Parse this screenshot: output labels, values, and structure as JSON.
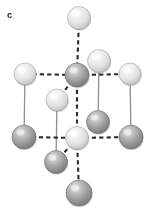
{
  "figure": {
    "panel_label": "c",
    "caption": "",
    "width": 153,
    "height": 211,
    "background": "#ffffff",
    "type": "crystal-structure-unit-cell"
  },
  "colors": {
    "light_atom_fill": "#e2e2e2",
    "light_atom_highlight": "#fbfbfb",
    "light_atom_edge": "#9a9a9a",
    "dark_atom_fill": "#9b9b9b",
    "dark_atom_highlight": "#d6d6d6",
    "dark_atom_edge": "#6a6a6a",
    "solid_bond": "#8f8f8f",
    "dashed_bond": "#2b2b2b",
    "label_color": "#1a1a1a"
  },
  "atoms": [
    {
      "id": "atom-top-apex",
      "cx": 79,
      "cy": 18,
      "r": 11.5,
      "shade": "light",
      "label": ""
    },
    {
      "id": "atom-upper-right",
      "cx": 99,
      "cy": 61,
      "r": 11.5,
      "shade": "light",
      "label": ""
    },
    {
      "id": "atom-center-upper",
      "cx": 77,
      "cy": 75,
      "r": 12.0,
      "shade": "dark",
      "label": ""
    },
    {
      "id": "atom-left-upper",
      "cx": 25,
      "cy": 74,
      "r": 11.0,
      "shade": "light",
      "label": ""
    },
    {
      "id": "atom-right-upper",
      "cx": 130,
      "cy": 74,
      "r": 11.0,
      "shade": "light",
      "label": ""
    },
    {
      "id": "atom-mid-left",
      "cx": 57,
      "cy": 100,
      "r": 11.0,
      "shade": "light",
      "label": ""
    },
    {
      "id": "atom-mid-right",
      "cx": 98,
      "cy": 122,
      "r": 11.5,
      "shade": "dark",
      "label": ""
    },
    {
      "id": "atom-left-lower",
      "cx": 24,
      "cy": 137,
      "r": 12.0,
      "shade": "dark",
      "label": ""
    },
    {
      "id": "atom-center-lower",
      "cx": 77,
      "cy": 138,
      "r": 11.5,
      "shade": "light",
      "label": ""
    },
    {
      "id": "atom-right-lower",
      "cx": 131,
      "cy": 137,
      "r": 12.0,
      "shade": "dark",
      "label": ""
    },
    {
      "id": "atom-lower-left-sub",
      "cx": 56,
      "cy": 162,
      "r": 11.5,
      "shade": "dark",
      "label": ""
    },
    {
      "id": "atom-bottom-apex",
      "cx": 79,
      "cy": 193,
      "r": 13.0,
      "shade": "dark",
      "label": ""
    }
  ],
  "bonds_dashed": [
    {
      "id": "bond-vertical-axis-top",
      "x1": 79,
      "y1": 18,
      "x2": 77,
      "y2": 75
    },
    {
      "id": "bond-vertical-axis-mid",
      "x1": 77,
      "y1": 75,
      "x2": 77,
      "y2": 138
    },
    {
      "id": "bond-vertical-axis-bottom",
      "x1": 77,
      "y1": 138,
      "x2": 79,
      "y2": 193
    },
    {
      "id": "bond-upper-horizontal-left",
      "x1": 25,
      "y1": 74,
      "x2": 77,
      "y2": 75
    },
    {
      "id": "bond-upper-horizontal-right",
      "x1": 77,
      "y1": 75,
      "x2": 130,
      "y2": 74
    },
    {
      "id": "bond-lower-horizontal-left",
      "x1": 24,
      "y1": 137,
      "x2": 77,
      "y2": 138
    },
    {
      "id": "bond-lower-horizontal-right",
      "x1": 77,
      "y1": 138,
      "x2": 131,
      "y2": 137
    },
    {
      "id": "bond-center-to-upper-right",
      "x1": 77,
      "y1": 75,
      "x2": 99,
      "y2": 61
    },
    {
      "id": "bond-center-to-mid-left",
      "x1": 77,
      "y1": 75,
      "x2": 57,
      "y2": 100
    },
    {
      "id": "bond-lower-to-mid-right",
      "x1": 77,
      "y1": 138,
      "x2": 98,
      "y2": 122
    },
    {
      "id": "bond-lower-to-lower-left",
      "x1": 77,
      "y1": 138,
      "x2": 56,
      "y2": 162
    }
  ],
  "bonds_solid": [
    {
      "id": "edge-left-vertical",
      "x1": 25,
      "y1": 74,
      "x2": 24,
      "y2": 137
    },
    {
      "id": "edge-right-vertical",
      "x1": 130,
      "y1": 74,
      "x2": 131,
      "y2": 137
    },
    {
      "id": "edge-inner-left-vertical",
      "x1": 57,
      "y1": 100,
      "x2": 56,
      "y2": 162
    },
    {
      "id": "edge-inner-right-vertical",
      "x1": 99,
      "y1": 61,
      "x2": 98,
      "y2": 122
    }
  ],
  "legend": {
    "entries": []
  }
}
